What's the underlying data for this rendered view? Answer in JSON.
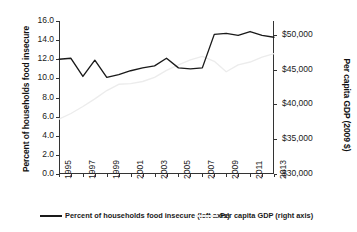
{
  "chart_data": {
    "type": "line",
    "title": "",
    "xlabel": "",
    "grid": false,
    "legend_position": "bottom",
    "x": [
      1995,
      1996,
      1997,
      1998,
      1999,
      2000,
      2001,
      2002,
      2003,
      2004,
      2005,
      2006,
      2007,
      2008,
      2009,
      2010,
      2011,
      2012,
      2013
    ],
    "xtick_labels": [
      "1995",
      "1997",
      "1999",
      "2001",
      "2003",
      "2005",
      "2007",
      "2009",
      "2011",
      "2013"
    ],
    "xtick_values": [
      1995,
      1997,
      1999,
      2001,
      2003,
      2005,
      2007,
      2009,
      2011,
      2013
    ],
    "xlim": [
      1995,
      2013
    ],
    "left_axis": {
      "label": "Percent of households food insecure",
      "ylim": [
        0.0,
        16.0
      ],
      "ticks": [
        0.0,
        2.0,
        4.0,
        6.0,
        8.0,
        10.0,
        12.0,
        14.0,
        16.0
      ],
      "tick_labels": [
        "0.0",
        "2.0",
        "4.0",
        "6.0",
        "8.0",
        "10.0",
        "12.0",
        "14.0",
        "16.0"
      ]
    },
    "right_axis": {
      "label": "Per capita GDP (2009 $)",
      "ylim": [
        30000,
        52000
      ],
      "ticks": [
        30000,
        35000,
        40000,
        45000,
        50000
      ],
      "tick_labels": [
        "$30,000",
        "$35,000",
        "$40,000",
        "$45,000",
        "$50,000"
      ]
    },
    "series": [
      {
        "name": "Percent of households food insecure (left axis)",
        "axis": "left",
        "color": "#1a1a1a",
        "values": [
          12.0,
          12.1,
          10.2,
          11.9,
          10.1,
          10.4,
          10.8,
          11.1,
          11.3,
          12.1,
          11.1,
          11.0,
          11.1,
          14.6,
          14.7,
          14.5,
          14.9,
          14.5,
          14.3
        ]
      },
      {
        "name": "Per capita GDP (right axis)",
        "axis": "right",
        "color": "#ececec",
        "values": [
          37900,
          38700,
          39700,
          40800,
          42000,
          42900,
          43000,
          43300,
          43900,
          44900,
          45700,
          46400,
          46900,
          46200,
          44700,
          45700,
          46100,
          46800,
          47300
        ]
      }
    ]
  },
  "legend": {
    "items": [
      {
        "label": "Percent of households food insecure (left axis)",
        "color": "#1a1a1a"
      },
      {
        "label": "Per capita GDP (right axis)",
        "color": "#ececec"
      }
    ]
  }
}
